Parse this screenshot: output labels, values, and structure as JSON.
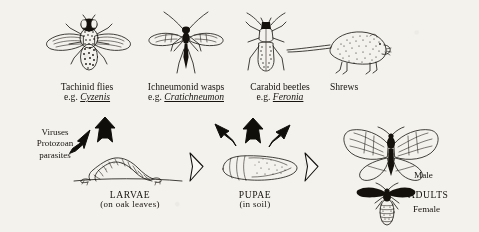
{
  "figure": {
    "background_color": "#f4f2ed",
    "ink_color": "#141210"
  },
  "enemies": [
    {
      "id": "tachinid-flies",
      "common_name": "Tachinid flies",
      "eg_prefix": "e.g. ",
      "genus": "Cyzenis",
      "icon": "tachinid-fly-icon"
    },
    {
      "id": "ichneumonid-wasps",
      "common_name": "Ichneumonid wasps",
      "eg_prefix": "e.g. ",
      "genus": "Cratichneumon",
      "icon": "ichneumonid-wasp-icon"
    },
    {
      "id": "carabid-beetles",
      "common_name": "Carabid beetles",
      "eg_prefix": "e.g. ",
      "genus": "Feronia",
      "icon": "carabid-beetle-icon"
    },
    {
      "id": "shrews",
      "common_name": "Shrews",
      "eg_prefix": "",
      "genus": "",
      "icon": "shrew-icon"
    }
  ],
  "pathogens": {
    "id": "viruses-protozoan-parasites",
    "line1": "Viruses",
    "line2": "Protozoan",
    "line3": "parasites"
  },
  "stages": [
    {
      "id": "larvae",
      "name": "LARVAE",
      "detail": "(on oak leaves)",
      "icon": "caterpillar-icon"
    },
    {
      "id": "pupae",
      "name": "PUPAE",
      "detail": "(in soil)",
      "icon": "pupa-icon"
    },
    {
      "id": "adults",
      "name": "ADULTS",
      "detail": "",
      "icon": "moth-icon"
    }
  ],
  "adult_sexes": {
    "male": "Male",
    "female": "Female",
    "group": "ADULTS"
  },
  "arrows": {
    "solid_note": "attack arrows from natural enemies to moth stages",
    "hollow_note": "life-cycle progression arrows"
  }
}
